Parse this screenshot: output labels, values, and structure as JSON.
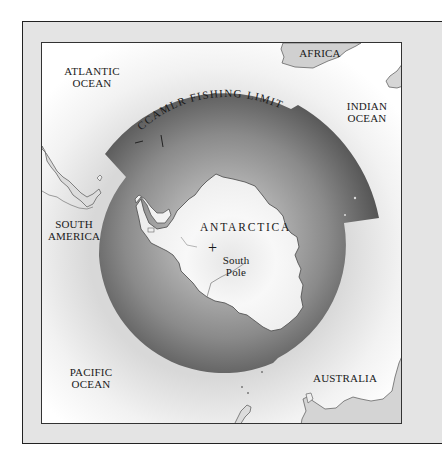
{
  "map": {
    "title": "CCAMLR Fishing Limit map of Antarctica",
    "zone_label": "CCAMLR FISHING LIMIT",
    "labels": {
      "atlantic_ocean_1": "ATLANTIC",
      "atlantic_ocean_2": "OCEAN",
      "africa": "AFRICA",
      "indian_ocean_1": "INDIAN",
      "indian_ocean_2": "OCEAN",
      "south_america_1": "SOUTH",
      "south_america_2": "AMERICA",
      "antarctica": "ANTARCTICA",
      "south_pole_marker": "+",
      "south_pole_1": "South",
      "south_pole_2": "Pole",
      "pacific_ocean_1": "PACIFIC",
      "pacific_ocean_2": "OCEAN",
      "australia": "AUSTRALIA"
    },
    "colors": {
      "frame": "#e4e4e4",
      "border": "#222222",
      "zone_dark": "#4a4a4a",
      "zone_light": "#a8a8a8",
      "land": "#f4f4f4",
      "coast": "#666666"
    }
  }
}
